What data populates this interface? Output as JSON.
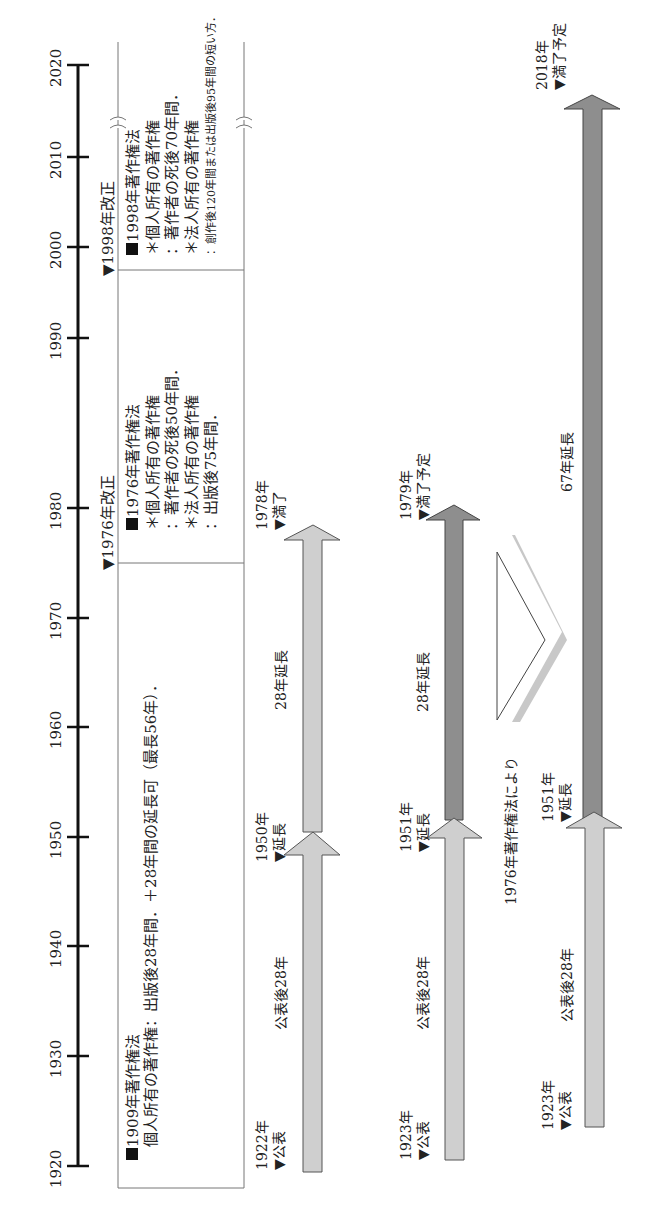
{
  "axis": {
    "ticks": [
      "1920",
      "1930",
      "1940",
      "1950",
      "1960",
      "1970",
      "1980",
      "1990",
      "2000",
      "2010",
      "2020"
    ],
    "range": [
      1920,
      2020
    ]
  },
  "revisions": [
    {
      "label": "▼1976年改正",
      "year": 1976
    },
    {
      "label": "▼1998年改正",
      "year": 1998
    }
  ],
  "law_boxes": [
    {
      "id": "1909",
      "title": "1909年著作権法",
      "lines": [
        "個人所有の著作権：出版後28年間．＋28年間の延長可（最長56年）．"
      ]
    },
    {
      "id": "1976",
      "title": "1976年著作権法",
      "lines": [
        "＊個人所有の著作権",
        "：著作者の死後50年間．",
        "＊法人所有の著作権",
        "：出版後75年間．"
      ]
    },
    {
      "id": "1998",
      "title": "1998年著作権法",
      "lines": [
        "＊個人所有の著作権",
        "：著作者の死後70年間．",
        "＊法人所有の著作権",
        "：創作後120年間または出版後95年間の短い方．"
      ]
    }
  ],
  "rows": [
    {
      "name": "work-1922",
      "start": {
        "year": "1922年",
        "event": "▼公表"
      },
      "first_span": "公表後28年",
      "middle": {
        "year": "1950年",
        "event": "▼延長"
      },
      "second_span": "28年延長",
      "end": {
        "year": "1978年",
        "event": "▼満了"
      }
    },
    {
      "name": "work-1923-old",
      "start": {
        "year": "1923年",
        "event": "▼公表"
      },
      "first_span": "公表後28年",
      "middle": {
        "year": "1951年",
        "event": "▼延長"
      },
      "second_span": "28年延長",
      "end": {
        "year": "1979年",
        "event": "▼満了予定"
      }
    },
    {
      "name": "work-1923-new",
      "start": {
        "year": "1923年",
        "event": "▼公表"
      },
      "first_span": "公表後28年",
      "middle": {
        "year": "1951年",
        "event": "▼延長"
      },
      "second_span": "67年延長",
      "end": {
        "year": "2018年",
        "event": "▼満了予定"
      }
    }
  ],
  "transition_label": "1976年著作権法により",
  "colors": {
    "light_arrow": "#cfcfcf",
    "dark_arrow": "#8e8e8e",
    "axis": "#111111",
    "box_border": "#777777"
  }
}
